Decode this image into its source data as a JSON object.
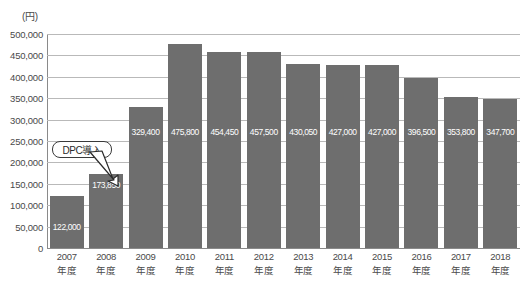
{
  "chart_data": {
    "type": "bar",
    "title": "",
    "subtitle": "",
    "unit_label": "(円)",
    "xlabel": "",
    "ylabel": "",
    "ylim": [
      0,
      500000
    ],
    "y_tick_step": 50000,
    "grid": true,
    "legend": "none",
    "bar_color": "#6e6e6e",
    "categories": [
      "2007\n年度",
      "2008\n年度",
      "2009\n年度",
      "2010\n年度",
      "2011\n年度",
      "2012\n年度",
      "2013\n年度",
      "2014\n年度",
      "2015\n年度",
      "2016\n年度",
      "2017\n年度",
      "2018\n年度"
    ],
    "category_years": [
      "2007",
      "2008",
      "2009",
      "2010",
      "2011",
      "2012",
      "2013",
      "2014",
      "2015",
      "2016",
      "2017",
      "2018"
    ],
    "category_suffix": "年度",
    "values": [
      122000,
      173850,
      329400,
      475800,
      457500,
      457500,
      430050,
      427000,
      427000,
      396500,
      353800,
      347700
    ],
    "value_labels": [
      "122,000",
      "173,850",
      "329,400",
      "475,800",
      "454,450",
      "457,500",
      "430,050",
      "427,000",
      "427,000",
      "396,500",
      "353,800",
      "347,700"
    ],
    "y_tick_labels": [
      "500,000",
      "450,000",
      "400,000",
      "350,000",
      "300,000",
      "250,000",
      "200,000",
      "150,000",
      "100,000",
      "50,000",
      "0"
    ],
    "y_tick_values": [
      500000,
      450000,
      400000,
      350000,
      300000,
      250000,
      200000,
      150000,
      100000,
      50000,
      0
    ],
    "annotations": [
      {
        "text": "DPC導入",
        "points_to_category": "2009\n年度",
        "style": "rounded-box-with-arrow"
      }
    ]
  },
  "annotation": {
    "label": "DPC導入"
  }
}
